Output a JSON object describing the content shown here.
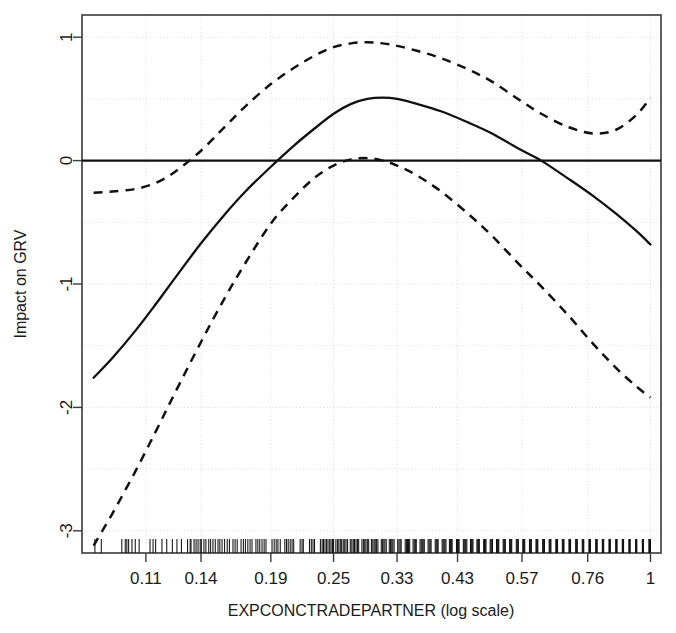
{
  "chart_data": {
    "type": "line",
    "title": "",
    "xlabel": "EXPCONCTRADEPARTNER (log scale)",
    "ylabel": "Impact on GRV",
    "x_tick_labels": [
      "0.11",
      "0.14",
      "0.19",
      "0.25",
      "0.33",
      "0.43",
      "0.57",
      "0.76",
      "1"
    ],
    "x_tick_values": [
      0.11,
      0.14,
      0.19,
      0.25,
      0.33,
      0.43,
      0.57,
      0.76,
      1
    ],
    "y_tick_labels": [
      "1",
      "0",
      "-1",
      "-2",
      "-3"
    ],
    "y_tick_values": [
      1,
      0,
      -1,
      -2,
      -3
    ],
    "xlim_log10": [
      -1.08,
      0.02
    ],
    "ylim": [
      -3.18,
      1.18
    ],
    "grid": true,
    "legend": "none",
    "log_x": true,
    "zero_reference_line": 0,
    "series": [
      {
        "name": "smooth-fit",
        "style": "solid",
        "color": "#111111",
        "x": [
          0.0875,
          0.095,
          0.105,
          0.115,
          0.125,
          0.14,
          0.155,
          0.17,
          0.19,
          0.21,
          0.23,
          0.25,
          0.27,
          0.29,
          0.31,
          0.33,
          0.36,
          0.4,
          0.45,
          0.5,
          0.56,
          0.62,
          0.7,
          0.78,
          0.86,
          0.94,
          1.0
        ],
        "y": [
          -1.76,
          -1.6,
          -1.38,
          -1.16,
          -0.95,
          -0.67,
          -0.44,
          -0.25,
          -0.05,
          0.12,
          0.26,
          0.38,
          0.46,
          0.5,
          0.51,
          0.5,
          0.46,
          0.4,
          0.31,
          0.22,
          0.1,
          0.0,
          -0.15,
          -0.29,
          -0.43,
          -0.57,
          -0.68
        ]
      },
      {
        "name": "upper-confidence-band",
        "style": "dashed",
        "color": "#111111",
        "x": [
          0.0875,
          0.095,
          0.105,
          0.115,
          0.125,
          0.14,
          0.155,
          0.17,
          0.19,
          0.21,
          0.23,
          0.25,
          0.27,
          0.29,
          0.31,
          0.33,
          0.36,
          0.4,
          0.45,
          0.5,
          0.56,
          0.62,
          0.7,
          0.78,
          0.86,
          0.94,
          1.0
        ],
        "y": [
          -0.26,
          -0.25,
          -0.23,
          -0.18,
          -0.09,
          0.08,
          0.27,
          0.44,
          0.62,
          0.75,
          0.85,
          0.92,
          0.95,
          0.96,
          0.95,
          0.93,
          0.89,
          0.83,
          0.74,
          0.64,
          0.5,
          0.38,
          0.27,
          0.22,
          0.25,
          0.37,
          0.51
        ]
      },
      {
        "name": "lower-confidence-band",
        "style": "dashed",
        "color": "#111111",
        "x": [
          0.0875,
          0.095,
          0.105,
          0.115,
          0.125,
          0.14,
          0.155,
          0.17,
          0.19,
          0.21,
          0.23,
          0.25,
          0.27,
          0.29,
          0.31,
          0.33,
          0.36,
          0.4,
          0.45,
          0.5,
          0.56,
          0.62,
          0.7,
          0.78,
          0.86,
          0.94,
          1.0
        ],
        "y": [
          -3.12,
          -2.86,
          -2.52,
          -2.19,
          -1.88,
          -1.47,
          -1.12,
          -0.83,
          -0.51,
          -0.3,
          -0.14,
          -0.04,
          0.01,
          0.02,
          0.0,
          -0.04,
          -0.12,
          -0.25,
          -0.43,
          -0.61,
          -0.83,
          -1.02,
          -1.26,
          -1.49,
          -1.68,
          -1.83,
          -1.92
        ]
      }
    ],
    "rug": {
      "name": "data-rug-marks",
      "positions": [
        0.088,
        0.0905,
        0.099,
        0.1005,
        0.1012,
        0.102,
        0.1035,
        0.105,
        0.1068,
        0.112,
        0.1135,
        0.1148,
        0.118,
        0.1205,
        0.1235,
        0.126,
        0.1285,
        0.132,
        0.1335,
        0.134,
        0.1358,
        0.137,
        0.1382,
        0.1395,
        0.1402,
        0.1418,
        0.143,
        0.1448,
        0.146,
        0.1475,
        0.149,
        0.1508,
        0.152,
        0.1535,
        0.1552,
        0.157,
        0.1585,
        0.161,
        0.1625,
        0.164,
        0.1668,
        0.1685,
        0.17,
        0.1718,
        0.1735,
        0.175,
        0.178,
        0.1795,
        0.181,
        0.1828,
        0.1845,
        0.186,
        0.191,
        0.1928,
        0.1945,
        0.196,
        0.198,
        0.202,
        0.2035,
        0.205,
        0.2068,
        0.2085,
        0.21,
        0.216,
        0.2178,
        0.219,
        0.225,
        0.2268,
        0.2285,
        0.23,
        0.236,
        0.2378,
        0.2392,
        0.2408,
        0.2425,
        0.244,
        0.2458,
        0.2472,
        0.2488,
        0.25,
        0.2525,
        0.2542,
        0.2558,
        0.2575,
        0.259,
        0.2608,
        0.2625,
        0.264,
        0.2658,
        0.269,
        0.2708,
        0.2725,
        0.274,
        0.2758,
        0.2775,
        0.279,
        0.283,
        0.2848,
        0.2865,
        0.288,
        0.2898,
        0.2915,
        0.295,
        0.2968,
        0.2985,
        0.3,
        0.3018,
        0.3035,
        0.308,
        0.3098,
        0.3115,
        0.313,
        0.3148,
        0.319,
        0.3208,
        0.3225,
        0.324,
        0.3258,
        0.331,
        0.3328,
        0.3345,
        0.336,
        0.342,
        0.3438,
        0.3455,
        0.347,
        0.3488,
        0.354,
        0.3558,
        0.3575,
        0.359,
        0.365,
        0.3668,
        0.3685,
        0.37,
        0.3718,
        0.378,
        0.3798,
        0.3815,
        0.383,
        0.39,
        0.3918,
        0.3935,
        0.395,
        0.402,
        0.4038,
        0.4055,
        0.407,
        0.4088,
        0.415,
        0.4168,
        0.4185,
        0.42,
        0.428,
        0.4298,
        0.4315,
        0.433,
        0.441,
        0.4428,
        0.4445,
        0.446,
        0.4478,
        0.455,
        0.4568,
        0.4585,
        0.46,
        0.468,
        0.4698,
        0.4715,
        0.473,
        0.482,
        0.4838,
        0.4855,
        0.487,
        0.496,
        0.4978,
        0.4995,
        0.501,
        0.51,
        0.5118,
        0.5135,
        0.515,
        0.525,
        0.5268,
        0.5285,
        0.53,
        0.54,
        0.5418,
        0.5435,
        0.545,
        0.556,
        0.5578,
        0.5595,
        0.561,
        0.572,
        0.5738,
        0.5755,
        0.577,
        0.589,
        0.5908,
        0.5925,
        0.594,
        0.606,
        0.6078,
        0.6095,
        0.611,
        0.624,
        0.6258,
        0.6275,
        0.629,
        0.642,
        0.6438,
        0.6455,
        0.647,
        0.661,
        0.6628,
        0.6645,
        0.666,
        0.68,
        0.6818,
        0.6835,
        0.685,
        0.7,
        0.7018,
        0.7035,
        0.705,
        0.721,
        0.7228,
        0.7245,
        0.726,
        0.742,
        0.7438,
        0.7455,
        0.747,
        0.764,
        0.7658,
        0.7675,
        0.769,
        0.787,
        0.7888,
        0.7905,
        0.792,
        0.81,
        0.8118,
        0.8135,
        0.815,
        0.834,
        0.8358,
        0.8375,
        0.839,
        0.859,
        0.8608,
        0.8625,
        0.864,
        0.884,
        0.8858,
        0.8875,
        0.889,
        0.91,
        0.9118,
        0.9135,
        0.915,
        0.937,
        0.9388,
        0.9405,
        0.942,
        0.965,
        0.9668,
        0.9685,
        0.97,
        0.993,
        0.9958,
        0.998,
        1.0
      ]
    }
  },
  "axis": {
    "y_title": "Impact on GRV",
    "x_title": "EXPCONCTRADEPARTNER (log scale)"
  }
}
